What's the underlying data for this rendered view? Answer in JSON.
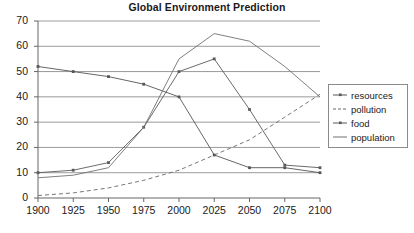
{
  "chart_data": {
    "type": "line",
    "title": "Global Environment Prediction",
    "xlabel": "",
    "ylabel": "",
    "x": [
      1900,
      1925,
      1950,
      1975,
      2000,
      2025,
      2050,
      2075,
      2100
    ],
    "xtick_labels": [
      "1900",
      "1925",
      "1950",
      "1975",
      "2000",
      "2025",
      "2050",
      "2075",
      "2100"
    ],
    "ytick_labels": [
      "0",
      "10",
      "20",
      "30",
      "40",
      "50",
      "60",
      "70"
    ],
    "yticks": [
      0,
      10,
      20,
      30,
      40,
      50,
      60,
      70
    ],
    "ylim": [
      0,
      70
    ],
    "xlim": [
      1900,
      2100
    ],
    "grid": true,
    "grid_axis": "y",
    "legend_position": "right",
    "series": [
      {
        "name": "resources",
        "color": "#555555",
        "dash": "solid",
        "marker": "square",
        "values": [
          52,
          50,
          48,
          45,
          40,
          17,
          12,
          12,
          10
        ]
      },
      {
        "name": "pollution",
        "color": "#666666",
        "dash": "dashed",
        "marker": "none",
        "values": [
          1,
          2,
          4,
          7,
          11,
          17,
          23,
          32,
          41
        ]
      },
      {
        "name": "food",
        "color": "#5a5a5a",
        "dash": "solid",
        "marker": "square",
        "values": [
          10,
          11,
          14,
          28,
          50,
          55,
          35,
          13,
          12
        ]
      },
      {
        "name": "population",
        "color": "#707070",
        "dash": "solid",
        "marker": "none",
        "values": [
          8,
          9,
          12,
          28,
          55,
          65,
          62,
          52,
          40
        ]
      }
    ]
  },
  "legend": {
    "items": [
      {
        "label": "resources"
      },
      {
        "label": "pollution"
      },
      {
        "label": "food"
      },
      {
        "label": "population"
      }
    ]
  },
  "colors": {
    "axis": "#666666",
    "grid": "#808080",
    "text": "#1a1a1a",
    "background": "#ffffff"
  }
}
